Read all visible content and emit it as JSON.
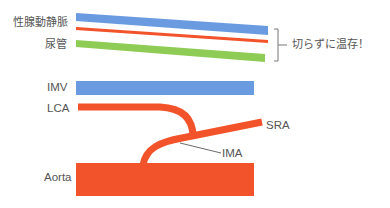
{
  "colors": {
    "vein_blue": "#6a9be0",
    "artery_red": "#f2532a",
    "ureter_green": "#8fcc55",
    "label_gray": "#555555",
    "line_gray": "#555555"
  },
  "top_section": {
    "labels": {
      "gonadal_vessels": "性腺動静脈",
      "ureter": "尿管"
    },
    "bracket_note": "切らずに温存！"
  },
  "bottom_section": {
    "labels": {
      "imv": "IMV",
      "lca": "LCA",
      "sra": "SRA",
      "ima": "IMA",
      "aorta": "Aorta"
    }
  }
}
